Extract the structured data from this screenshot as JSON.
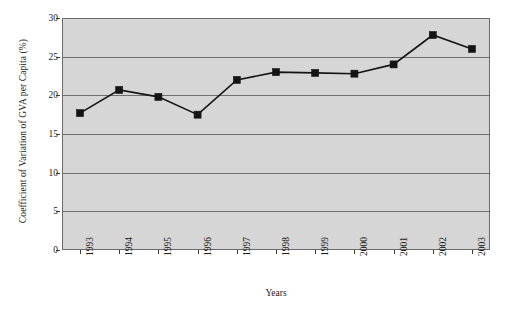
{
  "chart_data": {
    "type": "line",
    "title": "",
    "xlabel": "Years",
    "ylabel": "Coefficient of Variation of GVA per Capita (%)",
    "categories": [
      "1993",
      "1994",
      "1995",
      "1996",
      "1997",
      "1998",
      "1999",
      "2000",
      "2001",
      "2002",
      "2003"
    ],
    "values": [
      17.7,
      20.7,
      19.8,
      17.5,
      22.0,
      23.0,
      22.9,
      22.8,
      24.0,
      27.8,
      26.0
    ],
    "series": [
      {
        "name": "Coefficient of Variation of GVA per Capita",
        "values": [
          17.7,
          20.7,
          19.8,
          17.5,
          22.0,
          23.0,
          22.9,
          22.8,
          24.0,
          27.8,
          26.0
        ]
      }
    ],
    "ylim": [
      0,
      30
    ],
    "yticks": [
      0,
      5,
      10,
      15,
      20,
      25,
      30
    ],
    "ytick_labels": [
      "0",
      "5",
      "10",
      "15",
      "20",
      "25",
      "30"
    ],
    "grid": true,
    "legend": "none",
    "marker": "square",
    "line_color": "#141414",
    "marker_color": "#141414",
    "plot_background": "#d6d6d6",
    "gridline_color": "#6e6e6e",
    "frame_color": "#6b6b6b"
  },
  "axes": {
    "y_title": "Coefficient of Variation of GVA per Capita (%)",
    "x_title": "Years"
  }
}
